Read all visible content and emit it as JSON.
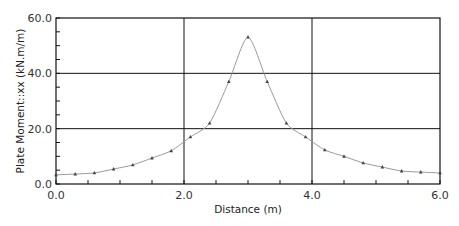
{
  "chart_data": {
    "type": "line",
    "title": "",
    "xlabel": "Distance (m)",
    "ylabel": "Plate Moment::xx (kN.m/m)",
    "xlim": [
      0.0,
      6.0
    ],
    "ylim": [
      0.0,
      60.0
    ],
    "x_ticks": [
      "0.0",
      "2.0",
      "4.0",
      "6.0"
    ],
    "y_ticks": [
      "0.0",
      "20.0",
      "40.0",
      "60.0"
    ],
    "x_tick_values": [
      0,
      2,
      4,
      6
    ],
    "y_tick_values": [
      0,
      20,
      40,
      60
    ],
    "grid": true,
    "legend": null,
    "series": [
      {
        "name": "Plate Moment::xx",
        "marker": "triangle",
        "color": "#9a9a9a",
        "marker_color": "#444444",
        "x": [
          0.0,
          0.3,
          0.6,
          0.9,
          1.2,
          1.5,
          1.8,
          2.1,
          2.4,
          2.7,
          3.0,
          3.3,
          3.6,
          3.9,
          4.2,
          4.5,
          4.8,
          5.1,
          5.4,
          5.7,
          6.0
        ],
        "values": [
          3.3,
          3.6,
          4.0,
          5.4,
          6.9,
          9.4,
          12.0,
          17.0,
          22.0,
          37.0,
          53.1,
          37.0,
          22.0,
          17.0,
          12.3,
          10.0,
          7.6,
          6.1,
          4.7,
          4.3,
          4.0
        ]
      }
    ]
  },
  "colors": {
    "grid": "#111111",
    "frame": "#111111",
    "curve": "#9a9a9a",
    "marker": "#444444",
    "background": "#ffffff"
  }
}
